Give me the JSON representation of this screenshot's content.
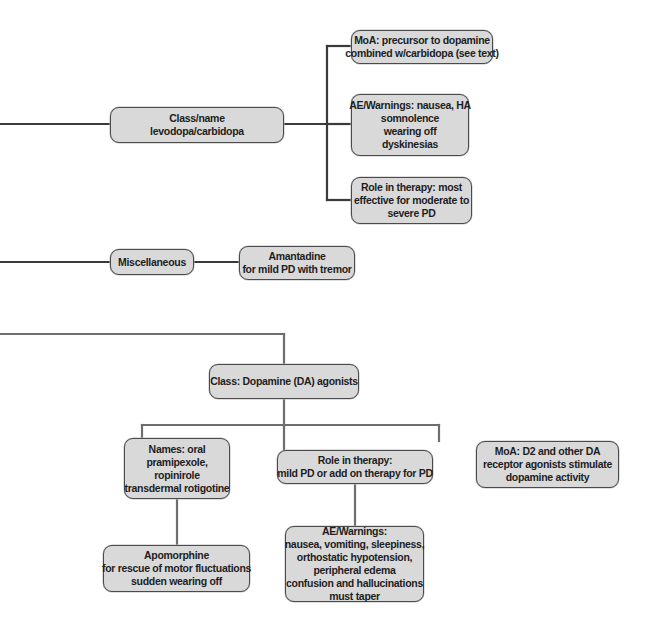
{
  "diagram": {
    "colors": {
      "node_fill": "#d9d9d9",
      "node_border": "#4a4a4a",
      "connector_dark": "#3a3a3a",
      "connector_gray": "#6e6e6e",
      "text": "#1e1e1e",
      "background": "#ffffff"
    },
    "levodopa_branch": {
      "class_node": {
        "lines": [
          "Class/name",
          "levodopa/carbidopa"
        ]
      },
      "moa_node": {
        "lines": [
          "MoA: precursor to dopamine",
          "combined w/carbidopa (see text)"
        ]
      },
      "ae_node": {
        "lines": [
          "AE/Warnings: nausea, HA",
          "somnolence",
          "wearing off",
          "dyskinesias"
        ]
      },
      "role_node": {
        "lines": [
          "Role in therapy: most",
          "effective for moderate to",
          "severe PD"
        ]
      }
    },
    "misc_branch": {
      "misc_node": {
        "lines": [
          "Miscellaneous"
        ]
      },
      "amantadine_node": {
        "lines": [
          "Amantadine",
          "for mild PD with tremor"
        ]
      }
    },
    "dopamine_agonist_branch": {
      "class_node": {
        "lines": [
          "Class: Dopamine (DA) agonists"
        ]
      },
      "names_node": {
        "lines": [
          "Names: oral",
          "pramipexole,",
          "ropinirole",
          "transdermal rotigotine"
        ]
      },
      "role_node": {
        "lines": [
          "Role in therapy:",
          "mild PD or add on therapy for PD"
        ]
      },
      "moa_node": {
        "lines": [
          "MoA: D2 and other DA",
          "receptor agonists stimulate",
          "dopamine activity"
        ]
      },
      "apomorphine_node": {
        "lines": [
          "Apomorphine",
          "for rescue of motor fluctuations",
          "sudden wearing off"
        ]
      },
      "ae_node": {
        "lines": [
          "AE/Warnings:",
          "nausea, vomiting, sleepiness,",
          "orthostatic hypotension,",
          "peripheral edema",
          "confusion and hallucinations",
          "must taper"
        ]
      }
    }
  }
}
